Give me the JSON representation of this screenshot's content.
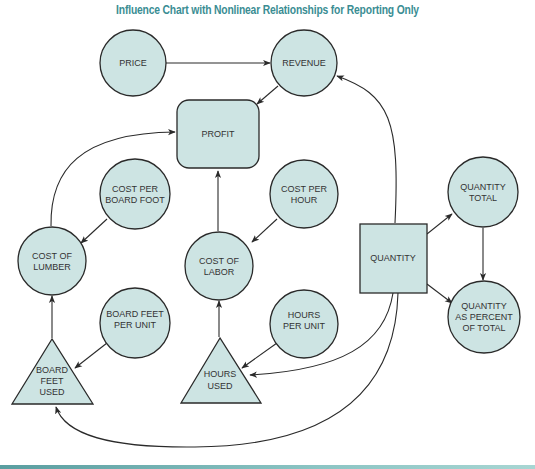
{
  "title": "Influence Chart with Nonlinear Relationships for Reporting Only",
  "colors": {
    "title": "#3a8d93",
    "node_fill": "#cde4e3",
    "node_stroke": "#2a2a2a",
    "bottom_rule": "#5a9ea0"
  },
  "nodes": {
    "price": {
      "shape": "circle",
      "lines": [
        "PRICE"
      ]
    },
    "revenue": {
      "shape": "circle",
      "lines": [
        "REVENUE"
      ]
    },
    "profit": {
      "shape": "rounded-rect",
      "lines": [
        "PROFIT"
      ]
    },
    "cost_per_board_foot": {
      "shape": "circle",
      "lines": [
        "COST PER",
        "BOARD FOOT"
      ]
    },
    "cost_of_lumber": {
      "shape": "circle",
      "lines": [
        "COST OF",
        "LUMBER"
      ]
    },
    "cost_per_hour": {
      "shape": "circle",
      "lines": [
        "COST PER",
        "HOUR"
      ]
    },
    "cost_of_labor": {
      "shape": "circle",
      "lines": [
        "COST OF",
        "LABOR"
      ]
    },
    "quantity": {
      "shape": "square",
      "lines": [
        "QUANTITY"
      ]
    },
    "quantity_total": {
      "shape": "circle",
      "lines": [
        "QUANTITY",
        "TOTAL"
      ]
    },
    "quantity_as_percent": {
      "shape": "circle",
      "lines": [
        "QUANTITY",
        "AS PERCENT",
        "OF TOTAL"
      ]
    },
    "board_feet_per_unit": {
      "shape": "circle",
      "lines": [
        "BOARD FEET",
        "PER UNIT"
      ]
    },
    "board_feet_used": {
      "shape": "triangle",
      "lines": [
        "BOARD",
        "FEET",
        "USED"
      ]
    },
    "hours_per_unit": {
      "shape": "circle",
      "lines": [
        "HOURS",
        "PER UNIT"
      ]
    },
    "hours_used": {
      "shape": "triangle",
      "lines": [
        "HOURS",
        "USED"
      ]
    }
  },
  "edges": [
    {
      "from": "PRICE",
      "to": "REVENUE"
    },
    {
      "from": "REVENUE",
      "to": "PROFIT"
    },
    {
      "from": "COST OF LUMBER",
      "to": "PROFIT"
    },
    {
      "from": "COST OF LABOR",
      "to": "PROFIT"
    },
    {
      "from": "COST PER BOARD FOOT",
      "to": "COST OF LUMBER"
    },
    {
      "from": "BOARD FEET USED",
      "to": "COST OF LUMBER"
    },
    {
      "from": "BOARD FEET PER UNIT",
      "to": "BOARD FEET USED"
    },
    {
      "from": "COST PER HOUR",
      "to": "COST OF LABOR"
    },
    {
      "from": "HOURS USED",
      "to": "COST OF LABOR"
    },
    {
      "from": "HOURS PER UNIT",
      "to": "HOURS USED"
    },
    {
      "from": "QUANTITY",
      "to": "REVENUE"
    },
    {
      "from": "QUANTITY",
      "to": "QUANTITY TOTAL"
    },
    {
      "from": "QUANTITY",
      "to": "QUANTITY AS PERCENT OF TOTAL"
    },
    {
      "from": "QUANTITY TOTAL",
      "to": "QUANTITY AS PERCENT OF TOTAL"
    },
    {
      "from": "QUANTITY",
      "to": "HOURS USED"
    },
    {
      "from": "QUANTITY",
      "to": "BOARD FEET USED"
    }
  ]
}
